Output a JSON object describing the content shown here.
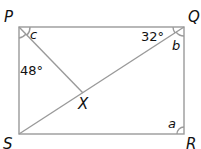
{
  "diagram": {
    "vertices": {
      "P": "P",
      "Q": "Q",
      "R": "R",
      "S": "S",
      "X": "X"
    },
    "angles": {
      "P_upper": "c",
      "P_lower": "48°",
      "Q_left": "32°",
      "Q_lower": "b",
      "R": "a"
    },
    "colors": {
      "line": "#9a9a9a",
      "text": "#111111"
    }
  }
}
